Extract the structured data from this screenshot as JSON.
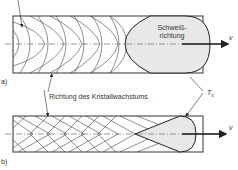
{
  "figure": {
    "panel_a_label": "a)",
    "panel_b_label": "b)",
    "weld_direction_line1": "Schweiß-",
    "weld_direction_line2": "richtung",
    "velocity_symbol": "v",
    "crystal_growth_label": "Richtung des Kristallwachstums",
    "solidus_label": "T",
    "solidus_sub": "s"
  },
  "colors": {
    "line": "#333333",
    "pool_fill": "#e8e8e8"
  }
}
